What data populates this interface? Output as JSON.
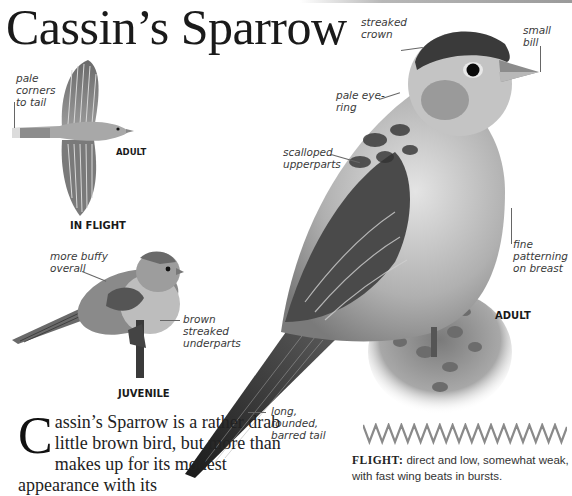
{
  "title": "Cassin’s Sparrow",
  "in_flight": {
    "caption": "IN FLIGHT",
    "sub_caption": "ADULT",
    "labels": {
      "tail": "pale\ncorners\nto tail"
    }
  },
  "juvenile": {
    "caption": "JUVENILE",
    "labels": {
      "buffy": "more buffy\noverall",
      "underparts": "brown\nstreaked\nunderparts"
    }
  },
  "adult": {
    "caption": "ADULT",
    "labels": {
      "crown": "streaked\ncrown",
      "bill": "small\nbill",
      "eyering": "pale eye-\nring",
      "upperparts": "scalloped\nupperparts",
      "breast": "fine\npatterning\non breast",
      "tail": "long,\nrounded,\nbarred tail"
    }
  },
  "body": {
    "drop_cap": "C",
    "text": "assin’s Sparrow is a rather drab little brown bird, but more than makes up for its modest appearance with its"
  },
  "flight": {
    "label": "FLIGHT:",
    "text": " direct and low, somewhat weak, with fast wing beats in bursts.",
    "zigzag_peaks": 16,
    "zigzag_color": "#8a8a8a"
  }
}
